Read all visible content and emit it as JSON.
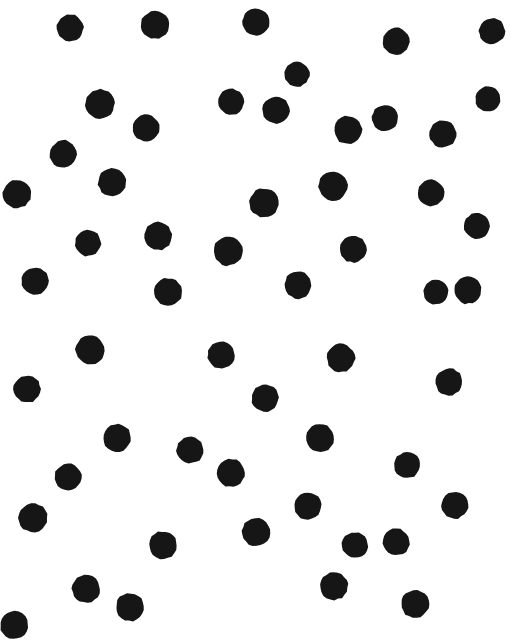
{
  "stimulus": {
    "title": "Random Dot Pattern",
    "type": "random-dot-array",
    "canvas_width": 515,
    "canvas_height": 643,
    "background_color": "#ffffff",
    "dot_color": "#161616",
    "dot_count": 73,
    "dot_mean_diameter": 26,
    "dot_shape": "circle",
    "edge_behavior": "clipped-at-borders",
    "notes": "Irregular hand-printed black circles scattered on white ground"
  },
  "chart_data": {
    "type": "scatter",
    "xlabel": "",
    "ylabel": "",
    "xlim": [
      0,
      515
    ],
    "ylim": [
      0,
      643
    ],
    "grid": false,
    "legend": false,
    "marker": "circle",
    "marker_color": "#161616",
    "point_count": 73,
    "columns": [
      "cx",
      "cy",
      "r",
      "rot"
    ],
    "points": [
      [
        70,
        28,
        13.5,
        12
      ],
      [
        155,
        25,
        14.0,
        -8
      ],
      [
        256,
        22,
        13.5,
        20
      ],
      [
        396,
        41,
        13.5,
        4
      ],
      [
        492,
        31,
        13.0,
        -15
      ],
      [
        297,
        74,
        12.5,
        9
      ],
      [
        100,
        104,
        14.5,
        -6
      ],
      [
        231,
        102,
        13.0,
        16
      ],
      [
        276,
        110,
        13.5,
        -11
      ],
      [
        385,
        118,
        13.0,
        7
      ],
      [
        488,
        99,
        12.5,
        -20
      ],
      [
        146,
        128,
        13.5,
        18
      ],
      [
        348,
        130,
        14.0,
        -4
      ],
      [
        443,
        134,
        13.5,
        11
      ],
      [
        63,
        154,
        13.5,
        -14
      ],
      [
        112,
        182,
        14.0,
        6
      ],
      [
        17,
        194,
        14.0,
        22
      ],
      [
        264,
        203,
        14.5,
        -9
      ],
      [
        333,
        186,
        14.5,
        13
      ],
      [
        431,
        193,
        13.0,
        -5
      ],
      [
        477,
        226,
        13.0,
        17
      ],
      [
        88,
        243,
        13.0,
        -12
      ],
      [
        158,
        236,
        14.0,
        8
      ],
      [
        228,
        251,
        14.5,
        -18
      ],
      [
        353,
        249,
        13.5,
        3
      ],
      [
        35,
        281,
        13.5,
        15
      ],
      [
        168,
        292,
        14.0,
        -7
      ],
      [
        298,
        285,
        13.5,
        21
      ],
      [
        436,
        292,
        12.5,
        -10
      ],
      [
        468,
        290,
        13.5,
        5
      ],
      [
        90,
        350,
        14.5,
        19
      ],
      [
        221,
        355,
        13.5,
        -13
      ],
      [
        341,
        358,
        14.0,
        2
      ],
      [
        27,
        389,
        13.5,
        -17
      ],
      [
        449,
        382,
        13.5,
        10
      ],
      [
        265,
        398,
        13.5,
        -3
      ],
      [
        117,
        438,
        14.0,
        14
      ],
      [
        190,
        450,
        13.5,
        -19
      ],
      [
        320,
        438,
        14.0,
        6
      ],
      [
        407,
        465,
        13.0,
        -8
      ],
      [
        68,
        477,
        13.5,
        23
      ],
      [
        231,
        473,
        14.0,
        -2
      ],
      [
        455,
        505,
        13.5,
        12
      ],
      [
        33,
        518,
        14.5,
        -16
      ],
      [
        163,
        545,
        14.0,
        4
      ],
      [
        256,
        532,
        14.0,
        -11
      ],
      [
        355,
        545,
        13.0,
        9
      ],
      [
        396,
        542,
        13.5,
        -6
      ],
      [
        86,
        589,
        14.0,
        18
      ],
      [
        130,
        607,
        14.0,
        -4
      ],
      [
        334,
        586,
        14.0,
        7
      ],
      [
        415,
        604,
        14.0,
        -15
      ],
      [
        14,
        625,
        14.0,
        11
      ],
      [
        308,
        506,
        13.5,
        -9
      ],
      [
        247,
        18,
        0.0,
        0
      ],
      [
        102,
        588,
        0.0,
        0
      ]
    ],
    "points_note": "Centre coordinates in pixels from top-left; r = radius; rot = slight rotation of the irregular blob"
  }
}
